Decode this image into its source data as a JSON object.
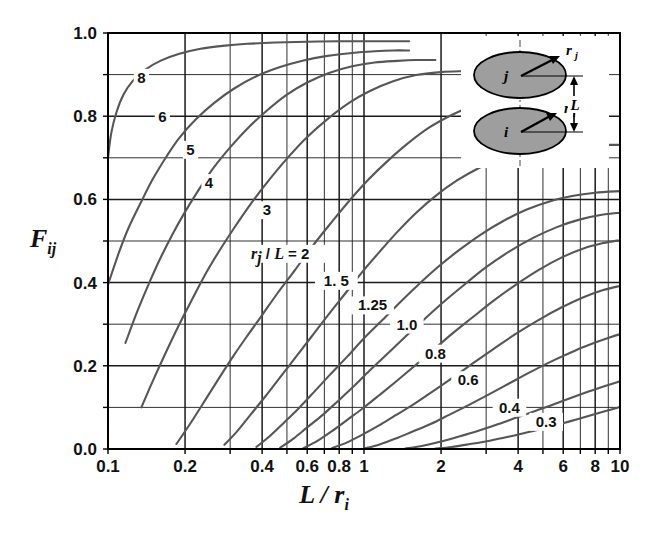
{
  "chart_data": {
    "type": "line",
    "title": "",
    "xlabel": "L / r_i",
    "ylabel": "F_ij",
    "xscale": "log",
    "yscale": "linear",
    "xlim": [
      0.1,
      10
    ],
    "ylim": [
      0.0,
      1.0
    ],
    "grid": true,
    "legend_position": "inline-curve-labels",
    "legend_title": "r_j / L",
    "xticks": [
      "0.1",
      "0.2",
      "0.4",
      "0.6",
      "0.8",
      "1",
      "2",
      "4",
      "6",
      "8",
      "10"
    ],
    "xtick_values": [
      0.1,
      0.2,
      0.4,
      0.6,
      0.8,
      1,
      2,
      4,
      6,
      8,
      10
    ],
    "xminor_values": [
      0.3,
      0.5,
      0.7,
      0.9,
      3,
      5,
      7,
      9
    ],
    "yticks": [
      "0.0",
      "0.2",
      "0.4",
      "0.6",
      "0.8",
      "1.0"
    ],
    "ytick_values": [
      0.0,
      0.2,
      0.4,
      0.6,
      0.8,
      1.0
    ],
    "yminor_values": [
      0.1,
      0.3,
      0.5,
      0.7,
      0.9
    ],
    "series": [
      {
        "name": "8",
        "label": "8",
        "label_at": {
          "x": 0.135,
          "y": 0.885
        },
        "points": [
          [
            0.1,
            0.7
          ],
          [
            0.103,
            0.76
          ],
          [
            0.108,
            0.81
          ],
          [
            0.115,
            0.852
          ],
          [
            0.125,
            0.885
          ],
          [
            0.14,
            0.912
          ],
          [
            0.16,
            0.933
          ],
          [
            0.19,
            0.95
          ],
          [
            0.23,
            0.962
          ],
          [
            0.28,
            0.969
          ],
          [
            0.35,
            0.974
          ],
          [
            0.45,
            0.977
          ],
          [
            0.6,
            0.979
          ],
          [
            0.8,
            0.98
          ],
          [
            1.0,
            0.98
          ],
          [
            1.3,
            0.98
          ],
          [
            1.5,
            0.98
          ]
        ]
      },
      {
        "name": "6",
        "label": "6",
        "label_at": {
          "x": 0.163,
          "y": 0.79
        },
        "points": [
          [
            0.1,
            0.395
          ],
          [
            0.11,
            0.47
          ],
          [
            0.12,
            0.53
          ],
          [
            0.135,
            0.595
          ],
          [
            0.15,
            0.65
          ],
          [
            0.17,
            0.705
          ],
          [
            0.19,
            0.748
          ],
          [
            0.22,
            0.792
          ],
          [
            0.26,
            0.832
          ],
          [
            0.31,
            0.866
          ],
          [
            0.38,
            0.896
          ],
          [
            0.47,
            0.918
          ],
          [
            0.58,
            0.934
          ],
          [
            0.72,
            0.945
          ],
          [
            0.9,
            0.952
          ],
          [
            1.1,
            0.956
          ],
          [
            1.3,
            0.958
          ],
          [
            1.5,
            0.958
          ]
        ]
      },
      {
        "name": "5",
        "label": "5",
        "label_at": {
          "x": 0.21,
          "y": 0.712
        },
        "points": [
          [
            0.117,
            0.255
          ],
          [
            0.13,
            0.33
          ],
          [
            0.145,
            0.4
          ],
          [
            0.16,
            0.458
          ],
          [
            0.18,
            0.52
          ],
          [
            0.2,
            0.57
          ],
          [
            0.23,
            0.63
          ],
          [
            0.26,
            0.678
          ],
          [
            0.3,
            0.725
          ],
          [
            0.35,
            0.77
          ],
          [
            0.42,
            0.815
          ],
          [
            0.5,
            0.852
          ],
          [
            0.6,
            0.881
          ],
          [
            0.73,
            0.904
          ],
          [
            0.9,
            0.92
          ],
          [
            1.1,
            0.929
          ],
          [
            1.35,
            0.933
          ],
          [
            1.6,
            0.935
          ],
          [
            1.9,
            0.935
          ]
        ]
      },
      {
        "name": "4",
        "label": "4",
        "label_at": {
          "x": 0.248,
          "y": 0.632
        },
        "points": [
          [
            0.135,
            0.1
          ],
          [
            0.15,
            0.165
          ],
          [
            0.17,
            0.238
          ],
          [
            0.19,
            0.3
          ],
          [
            0.21,
            0.352
          ],
          [
            0.24,
            0.42
          ],
          [
            0.27,
            0.473
          ],
          [
            0.31,
            0.53
          ],
          [
            0.36,
            0.588
          ],
          [
            0.42,
            0.642
          ],
          [
            0.5,
            0.698
          ],
          [
            0.6,
            0.75
          ],
          [
            0.72,
            0.793
          ],
          [
            0.88,
            0.833
          ],
          [
            1.05,
            0.86
          ],
          [
            1.3,
            0.884
          ],
          [
            1.6,
            0.899
          ],
          [
            2.0,
            0.906
          ],
          [
            2.4,
            0.908
          ],
          [
            2.8,
            0.908
          ]
        ]
      },
      {
        "name": "3",
        "label": "3",
        "label_at": {
          "x": 0.418,
          "y": 0.567
        },
        "points": [
          [
            0.185,
            0.012
          ],
          [
            0.21,
            0.062
          ],
          [
            0.24,
            0.118
          ],
          [
            0.27,
            0.168
          ],
          [
            0.31,
            0.225
          ],
          [
            0.35,
            0.272
          ],
          [
            0.4,
            0.322
          ],
          [
            0.46,
            0.375
          ],
          [
            0.54,
            0.432
          ],
          [
            0.63,
            0.488
          ],
          [
            0.74,
            0.542
          ],
          [
            0.88,
            0.598
          ],
          [
            1.05,
            0.65
          ],
          [
            1.25,
            0.695
          ],
          [
            1.5,
            0.737
          ],
          [
            1.8,
            0.773
          ],
          [
            2.2,
            0.803
          ],
          [
            2.7,
            0.827
          ],
          [
            3.3,
            0.843
          ],
          [
            4.0,
            0.852
          ],
          [
            5.0,
            0.857
          ],
          [
            6.0,
            0.858
          ]
        ]
      },
      {
        "name": "2",
        "label": "r_j / L = 2",
        "label_at": {
          "x": 0.5,
          "y": 0.462
        },
        "points": [
          [
            0.285,
            0.01
          ],
          [
            0.32,
            0.043
          ],
          [
            0.36,
            0.082
          ],
          [
            0.41,
            0.125
          ],
          [
            0.47,
            0.172
          ],
          [
            0.54,
            0.22
          ],
          [
            0.62,
            0.268
          ],
          [
            0.72,
            0.32
          ],
          [
            0.84,
            0.372
          ],
          [
            0.98,
            0.424
          ],
          [
            1.15,
            0.474
          ],
          [
            1.35,
            0.522
          ],
          [
            1.6,
            0.568
          ],
          [
            1.9,
            0.608
          ],
          [
            2.3,
            0.645
          ],
          [
            2.8,
            0.675
          ],
          [
            3.4,
            0.698
          ],
          [
            4.2,
            0.714
          ],
          [
            5.2,
            0.724
          ],
          [
            6.5,
            0.729
          ],
          [
            8.0,
            0.731
          ],
          [
            10,
            0.731
          ]
        ]
      },
      {
        "name": "1.5",
        "label": "1. 5",
        "label_at": {
          "x": 0.78,
          "y": 0.397
        },
        "points": [
          [
            0.38,
            0.005
          ],
          [
            0.43,
            0.032
          ],
          [
            0.49,
            0.065
          ],
          [
            0.56,
            0.1
          ],
          [
            0.64,
            0.138
          ],
          [
            0.74,
            0.18
          ],
          [
            0.86,
            0.222
          ],
          [
            1.0,
            0.266
          ],
          [
            1.18,
            0.31
          ],
          [
            1.4,
            0.356
          ],
          [
            1.65,
            0.398
          ],
          [
            1.95,
            0.438
          ],
          [
            2.35,
            0.478
          ],
          [
            2.85,
            0.515
          ],
          [
            3.5,
            0.548
          ],
          [
            4.3,
            0.575
          ],
          [
            5.3,
            0.595
          ],
          [
            6.5,
            0.608
          ],
          [
            8.0,
            0.616
          ],
          [
            10,
            0.62
          ]
        ]
      },
      {
        "name": "1.25",
        "label": "1.25",
        "label_at": {
          "x": 1.08,
          "y": 0.338
        },
        "points": [
          [
            0.47,
            0.003
          ],
          [
            0.53,
            0.025
          ],
          [
            0.6,
            0.052
          ],
          [
            0.69,
            0.082
          ],
          [
            0.79,
            0.115
          ],
          [
            0.91,
            0.15
          ],
          [
            1.05,
            0.188
          ],
          [
            1.22,
            0.226
          ],
          [
            1.45,
            0.27
          ],
          [
            1.72,
            0.312
          ],
          [
            2.05,
            0.354
          ],
          [
            2.5,
            0.398
          ],
          [
            3.0,
            0.437
          ],
          [
            3.7,
            0.475
          ],
          [
            4.6,
            0.508
          ],
          [
            5.7,
            0.534
          ],
          [
            7.0,
            0.552
          ],
          [
            8.5,
            0.563
          ],
          [
            10,
            0.568
          ]
        ]
      },
      {
        "name": "1.0",
        "label": "1.0",
        "label_at": {
          "x": 1.47,
          "y": 0.292
        },
        "points": [
          [
            0.58,
            0.002
          ],
          [
            0.66,
            0.02
          ],
          [
            0.75,
            0.043
          ],
          [
            0.86,
            0.07
          ],
          [
            0.99,
            0.098
          ],
          [
            1.14,
            0.128
          ],
          [
            1.32,
            0.16
          ],
          [
            1.55,
            0.196
          ],
          [
            1.85,
            0.236
          ],
          [
            2.2,
            0.276
          ],
          [
            2.65,
            0.316
          ],
          [
            3.2,
            0.356
          ],
          [
            3.9,
            0.394
          ],
          [
            4.8,
            0.43
          ],
          [
            5.9,
            0.46
          ],
          [
            7.2,
            0.482
          ],
          [
            8.6,
            0.495
          ],
          [
            10,
            0.502
          ]
        ]
      },
      {
        "name": "0.8",
        "label": "0.8",
        "label_at": {
          "x": 1.9,
          "y": 0.222
        },
        "points": [
          [
            0.75,
            0.002
          ],
          [
            0.86,
            0.016
          ],
          [
            0.99,
            0.035
          ],
          [
            1.14,
            0.056
          ],
          [
            1.32,
            0.08
          ],
          [
            1.55,
            0.106
          ],
          [
            1.85,
            0.138
          ],
          [
            2.2,
            0.17
          ],
          [
            2.65,
            0.205
          ],
          [
            3.2,
            0.24
          ],
          [
            3.9,
            0.276
          ],
          [
            4.8,
            0.31
          ],
          [
            5.9,
            0.34
          ],
          [
            7.2,
            0.365
          ],
          [
            8.6,
            0.382
          ],
          [
            10,
            0.392
          ]
        ]
      },
      {
        "name": "0.6",
        "label": "0.6",
        "label_at": {
          "x": 2.55,
          "y": 0.158
        },
        "points": [
          [
            1.0,
            0.001
          ],
          [
            1.15,
            0.011
          ],
          [
            1.33,
            0.025
          ],
          [
            1.55,
            0.042
          ],
          [
            1.82,
            0.06
          ],
          [
            2.15,
            0.082
          ],
          [
            2.55,
            0.105
          ],
          [
            3.05,
            0.13
          ],
          [
            3.7,
            0.158
          ],
          [
            4.5,
            0.186
          ],
          [
            5.5,
            0.213
          ],
          [
            6.7,
            0.237
          ],
          [
            8.1,
            0.257
          ],
          [
            9.3,
            0.27
          ],
          [
            10,
            0.276
          ]
        ]
      },
      {
        "name": "0.4",
        "label": "0.4",
        "label_at": {
          "x": 3.7,
          "y": 0.092
        },
        "points": [
          [
            1.45,
            0.001
          ],
          [
            1.7,
            0.008
          ],
          [
            2.0,
            0.018
          ],
          [
            2.35,
            0.03
          ],
          [
            2.8,
            0.044
          ],
          [
            3.35,
            0.06
          ],
          [
            4.0,
            0.077
          ],
          [
            4.9,
            0.096
          ],
          [
            6.0,
            0.116
          ],
          [
            7.3,
            0.135
          ],
          [
            8.8,
            0.152
          ],
          [
            10,
            0.163
          ]
        ]
      },
      {
        "name": "0.3",
        "label": "0.3",
        "label_at": {
          "x": 5.15,
          "y": 0.058
        },
        "points": [
          [
            1.9,
            0.001
          ],
          [
            2.2,
            0.005
          ],
          [
            2.6,
            0.012
          ],
          [
            3.1,
            0.02
          ],
          [
            3.7,
            0.03
          ],
          [
            4.4,
            0.041
          ],
          [
            5.3,
            0.053
          ],
          [
            6.4,
            0.067
          ],
          [
            7.7,
            0.081
          ],
          [
            9.0,
            0.093
          ],
          [
            10,
            0.101
          ]
        ]
      }
    ],
    "inset": {
      "top_body_label": "j",
      "bottom_body_label": "i",
      "top_radius_label": "r",
      "top_radius_sub": "j",
      "bottom_radius_label": "r",
      "bottom_radius_sub": "i",
      "distance_label": "L",
      "body_fill": "#9e9e9e",
      "body_stroke": "#000000"
    },
    "colors": {
      "curve": "#565656",
      "grid": "#1a1a1a",
      "axis": "#000000",
      "text": "#111111",
      "background": "#ffffff"
    }
  }
}
